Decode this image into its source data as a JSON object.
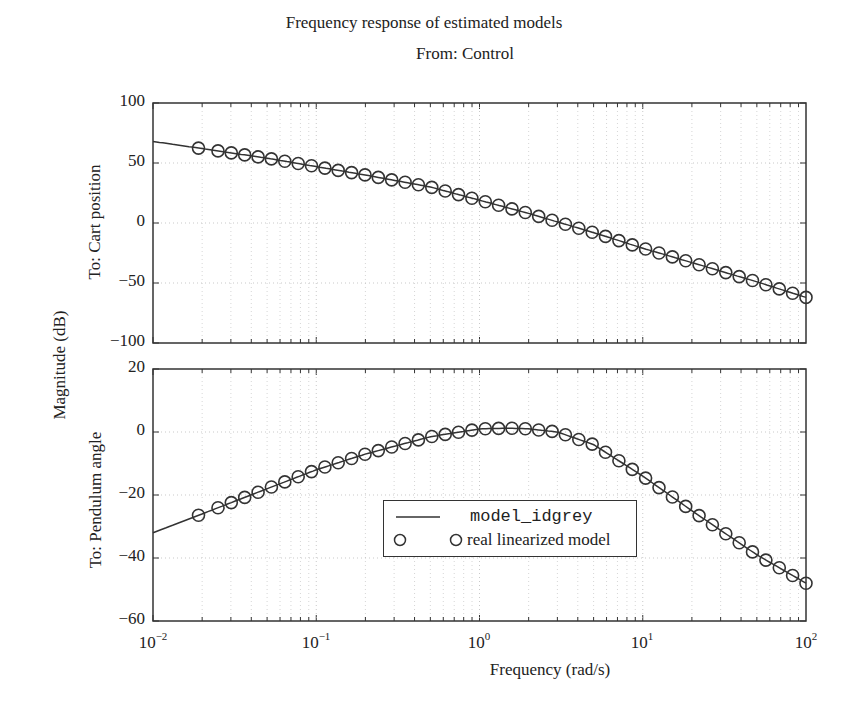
{
  "chart_data": {
    "type": "line",
    "title": "Frequency response of estimated models",
    "subtitle": "From: Control",
    "xlabel": "Frequency  (rad/s)",
    "ylabel": "Magnitude (dB)",
    "xscale": "log",
    "xlim": [
      0.01,
      100
    ],
    "x_tick_labels": [
      "10^-2",
      "10^-1",
      "10^0",
      "10^1",
      "10^2"
    ],
    "grid": true,
    "legend": {
      "position": "inside lower center (bottom subplot)",
      "entries": [
        {
          "label": "model_idgrey",
          "style": "solid line"
        },
        {
          "label": "real linearized model",
          "style": "circle markers"
        }
      ]
    },
    "subplots": [
      {
        "name": "To: Cart position",
        "ylim": [
          -100,
          100
        ],
        "y_ticks": [
          100,
          50,
          0,
          -50,
          -100
        ],
        "series": [
          {
            "name": "model_idgrey",
            "x": [
              0.01,
              0.02,
              0.05,
              0.1,
              0.2,
              0.5,
              1,
              2,
              5,
              10,
              20,
              50,
              100
            ],
            "values": [
              68,
              62,
              54,
              47,
              40,
              30,
              19,
              8,
              -8,
              -21,
              -33,
              -49,
              -62
            ]
          },
          {
            "name": "real linearized model",
            "x": [
              0.019,
              0.05,
              0.1,
              0.2,
              0.5,
              1,
              2,
              5,
              10,
              20,
              50,
              100
            ],
            "values": [
              62,
              54,
              47,
              40,
              30,
              19,
              8,
              -8,
              -21,
              -33,
              -49,
              -62
            ]
          }
        ]
      },
      {
        "name": "To: Pendulum angle",
        "ylim": [
          -60,
          20
        ],
        "y_ticks": [
          20,
          0,
          -20,
          -40,
          -60
        ],
        "series": [
          {
            "name": "model_idgrey",
            "x": [
              0.01,
              0.02,
              0.05,
              0.1,
              0.2,
              0.5,
              1,
              1.5,
              2,
              3,
              5,
              10,
              20,
              50,
              100
            ],
            "values": [
              -32,
              -26,
              -18,
              -12,
              -7,
              -1.5,
              1,
              1.2,
              1,
              0,
              -4,
              -14,
              -25,
              -39,
              -48
            ]
          },
          {
            "name": "real linearized model",
            "x": [
              0.019,
              0.05,
              0.1,
              0.2,
              0.5,
              1,
              1.5,
              2,
              3,
              5,
              10,
              20,
              50,
              100
            ],
            "values": [
              -26,
              -18,
              -12,
              -7,
              -1.5,
              1,
              1.2,
              1,
              0,
              -4,
              -14,
              -25,
              -39,
              -48
            ]
          }
        ]
      }
    ]
  },
  "labels": {
    "title": "Frequency response of estimated models",
    "subtitle": "From: Control",
    "ylabel": "Magnitude (dB)",
    "top_ylabel": "To: Cart position",
    "bottom_ylabel": "To: Pendulum angle",
    "xlabel": "Frequency  (rad/s)",
    "top_ticks": [
      "100",
      "50",
      "0",
      "−50",
      "−100"
    ],
    "bottom_ticks": [
      "20",
      "0",
      "−20",
      "−40",
      "−60"
    ],
    "x_base": "10",
    "x_exps": [
      "−2",
      "−1",
      "0",
      "1",
      "2"
    ],
    "legend_line": "model_idgrey",
    "legend_marker": "real linearized model"
  }
}
